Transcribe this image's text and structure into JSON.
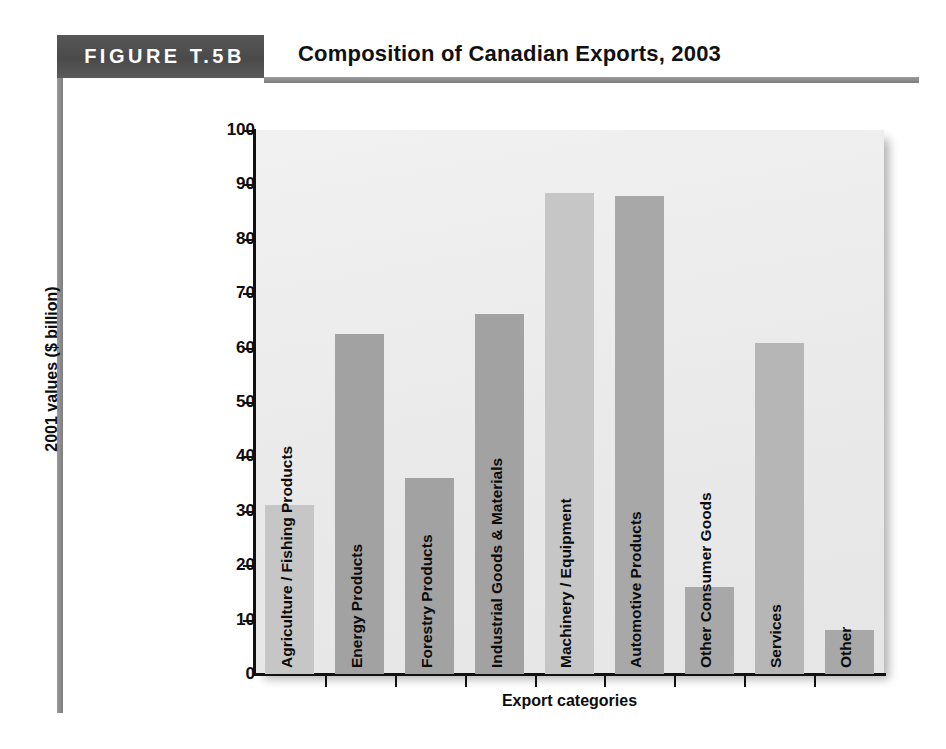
{
  "figure": {
    "tag": "FIGURE T.5B",
    "title": "Composition of Canadian Exports, 2003"
  },
  "chart_data": {
    "type": "bar",
    "title": "Composition of Canadian Exports, 2003",
    "xlabel": "Export categories",
    "ylabel": "2001 values ($ billion)",
    "ylim": [
      0,
      100
    ],
    "ytick_step": 10,
    "yticks": [
      "100",
      "90",
      "80",
      "70",
      "60",
      "50",
      "40",
      "30",
      "20",
      "10",
      "0"
    ],
    "grid": false,
    "legend": "none",
    "categories": [
      "Agriculture / Fishing Products",
      "Energy Products",
      "Forestry Products",
      "Industrial Goods & Materials",
      "Machinery / Equipment",
      "Automotive Products",
      "Other Consumer Goods",
      "Services",
      "Other"
    ],
    "values": [
      31,
      62.5,
      36,
      66.2,
      88.4,
      87.8,
      16,
      60.8,
      8
    ],
    "bar_colors": [
      "#c6c6c6",
      "#a2a2a2",
      "#a2a2a2",
      "#a2a2a2",
      "#c6c6c6",
      "#a8a8a8",
      "#a8a8a8",
      "#b6b6b6",
      "#a8a8a8"
    ]
  },
  "colors": {
    "header_band": "#4f4f4f",
    "rule": "#8d8d8d",
    "plot_background": "#eeeeee",
    "axis": "#111111"
  }
}
